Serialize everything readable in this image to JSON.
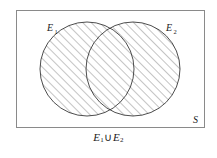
{
  "figure": {
    "name": "venn-diagram-union",
    "caption": {
      "full_text": "E1 ∪ E2",
      "left_symbol": "E",
      "left_subscript": "1",
      "operator": "∪",
      "right_symbol": "E",
      "right_subscript": "2"
    },
    "universe": {
      "label": "S",
      "label_position": "bottom-right-inside",
      "border_color": "#8a8a8a",
      "fill_color": "#ffffff",
      "x": 16,
      "y": 10,
      "width": 189,
      "height": 118
    },
    "sets": [
      {
        "label": "E",
        "subscript": "1",
        "label_position": "top-left-inside",
        "cx": 87,
        "cy": 69,
        "r": 47,
        "shaded": true,
        "stroke_color": "#3a3a3a",
        "label_x": 47,
        "label_y": 31
      },
      {
        "label": "E",
        "subscript": "2",
        "label_position": "top-right-inside",
        "cx": 133,
        "cy": 69,
        "r": 47,
        "shaded": true,
        "stroke_color": "#3a3a3a",
        "label_x": 166,
        "label_y": 31
      }
    ],
    "shading": {
      "style": "diagonal-hatch",
      "angle_degrees": 45,
      "direction": "lower-left-to-upper-right",
      "spacing_px": 6,
      "line_color": "#555555",
      "region_description": "entire area of both circles (union)"
    },
    "colors": {
      "ink": "#1a1a1a",
      "circle_stroke": "#3a3a3a",
      "rect_stroke": "#8a8a8a",
      "hatch": "#555555",
      "background": "#ffffff"
    }
  }
}
